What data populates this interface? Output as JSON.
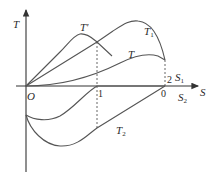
{
  "diagram": {
    "axes": {
      "y_label": "T",
      "x_label": "S",
      "origin_label": "O"
    },
    "ticks": {
      "x_mark_1": "1",
      "x_mark_2": "2",
      "x_mark_0": "0"
    },
    "segment_labels": {
      "s1": "S",
      "s1_sub": "1",
      "s2": "S",
      "s2_sub": "2"
    },
    "curves": {
      "t_prime": "T'",
      "t1": "T",
      "t1_sub": "1",
      "t": "T",
      "t2": "T",
      "t2_sub": "2"
    },
    "colors": {
      "stroke": "#555555",
      "axis": "#333333",
      "text": "#2a2a2a"
    }
  }
}
